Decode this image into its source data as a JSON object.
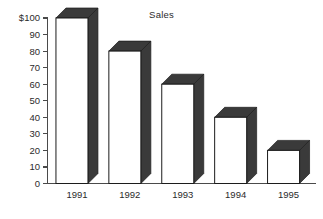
{
  "chart_data": {
    "type": "bar",
    "title": "Sales",
    "xlabel": "",
    "ylabel": "",
    "categories": [
      "1991",
      "1992",
      "1993",
      "1994",
      "1995"
    ],
    "values": [
      100,
      80,
      60,
      40,
      20
    ],
    "ylim": [
      0,
      100
    ],
    "yticks": [
      0,
      10,
      20,
      30,
      40,
      50,
      60,
      70,
      80,
      90,
      100
    ],
    "ytick_labels": [
      "0",
      "10",
      "20",
      "30",
      "40",
      "50",
      "60",
      "70",
      "80",
      "90",
      "$100"
    ],
    "grid": false,
    "legend": false,
    "legend_position": "none",
    "style": "3d-column",
    "colors": {
      "bar_face": "#ffffff",
      "bar_side": "#3a3a3a",
      "bar_outline": "#1c1c1c",
      "axis": "#4a4a4a",
      "text": "#2b2b2b",
      "background": "#ffffff"
    }
  }
}
